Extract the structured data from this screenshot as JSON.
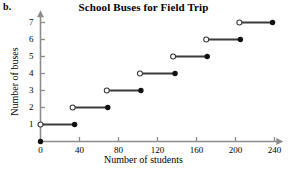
{
  "panel": {
    "letter": "b."
  },
  "chart_data": {
    "type": "line",
    "subtype": "step-function",
    "title": "School Buses for Field Trip",
    "xlabel": "Number of students",
    "ylabel": "Number of buses",
    "xlim": [
      0,
      247
    ],
    "ylim": [
      0,
      7.6
    ],
    "grid": false,
    "legend": null,
    "xticks": [
      0,
      40,
      80,
      120,
      160,
      200,
      240
    ],
    "xtick_labels": [
      "0",
      "40",
      "80",
      "120",
      "160",
      "200",
      "240"
    ],
    "yticks": [
      1,
      2,
      3,
      4,
      5,
      6,
      7
    ],
    "ytick_labels": [
      "1",
      "2",
      "3",
      "4",
      "5",
      "6",
      "7"
    ],
    "origin_point": {
      "x": 0,
      "y": 0,
      "marker": "filled"
    },
    "steps": [
      {
        "y": 1,
        "x_start": 0,
        "x_end": 35,
        "start_marker": "open",
        "end_marker": "filled"
      },
      {
        "y": 2,
        "x_start": 33,
        "x_end": 69,
        "start_marker": "open",
        "end_marker": "filled"
      },
      {
        "y": 3,
        "x_start": 68,
        "x_end": 103,
        "start_marker": "open",
        "end_marker": "filled"
      },
      {
        "y": 4,
        "x_start": 102,
        "x_end": 138,
        "start_marker": "open",
        "end_marker": "filled"
      },
      {
        "y": 5,
        "x_start": 136,
        "x_end": 171,
        "start_marker": "open",
        "end_marker": "filled"
      },
      {
        "y": 6,
        "x_start": 170,
        "x_end": 205,
        "start_marker": "open",
        "end_marker": "filled"
      },
      {
        "y": 7,
        "x_start": 204,
        "x_end": 238,
        "start_marker": "open",
        "end_marker": "filled"
      }
    ],
    "colors": {
      "axis": "#8c8c8c",
      "step_line": "#3a3a3a",
      "marker_fill": "#111111",
      "marker_open_fill": "#ffffff",
      "text": "#000000"
    }
  }
}
